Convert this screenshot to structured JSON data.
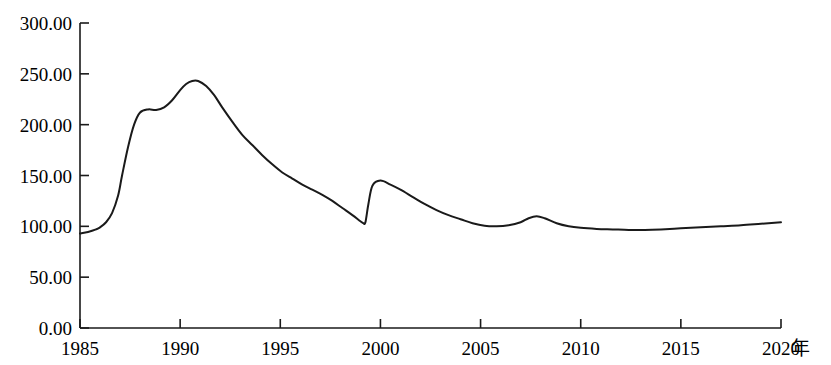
{
  "chart_data": {
    "type": "line",
    "title": "",
    "subtitle": "",
    "xlabel": "年",
    "ylabel": "",
    "xlim": [
      1985,
      2020
    ],
    "ylim": [
      0,
      300
    ],
    "grid": false,
    "legend": null,
    "x_ticks": [
      "1985",
      "1990",
      "1995",
      "2000",
      "2005",
      "2010",
      "2015",
      "2020"
    ],
    "x_tick_values": [
      1985,
      1990,
      1995,
      2000,
      2005,
      2010,
      2015,
      2020
    ],
    "y_ticks": [
      "0.00",
      "50.00",
      "100.00",
      "150.00",
      "200.00",
      "250.00",
      "300.00"
    ],
    "y_tick_values": [
      0,
      50,
      100,
      150,
      200,
      250,
      300
    ],
    "line_color": "#1a1a1a",
    "line_width": 2,
    "series": [
      {
        "name": "index",
        "x": [
          1985.0,
          1985.4,
          1985.8,
          1986.0,
          1986.3,
          1986.6,
          1986.9,
          1987.1,
          1987.4,
          1987.7,
          1988.0,
          1988.4,
          1988.8,
          1989.2,
          1989.6,
          1990.0,
          1990.3,
          1990.6,
          1990.9,
          1991.3,
          1991.7,
          1992.1,
          1992.6,
          1993.1,
          1993.6,
          1994.1,
          1994.6,
          1995.1,
          1995.6,
          1996.1,
          1996.6,
          1997.1,
          1997.6,
          1998.1,
          1998.6,
          1999.0,
          1999.15,
          1999.25,
          1999.4,
          1999.6,
          2000.0,
          2000.5,
          2001.0,
          2001.6,
          2002.2,
          2002.8,
          2003.4,
          2004.0,
          2004.6,
          2005.2,
          2005.8,
          2006.4,
          2007.0,
          2007.4,
          2007.8,
          2008.2,
          2008.8,
          2009.4,
          2010.0,
          2010.8,
          2011.6,
          2012.4,
          2013.2,
          2014.0,
          2015.0,
          2016.0,
          2017.0,
          2018.0,
          2019.0,
          2020.0
        ],
        "y": [
          93.0,
          94.5,
          97.0,
          99.0,
          104.0,
          113.0,
          130.0,
          150.0,
          178.0,
          200.0,
          212.0,
          215.0,
          214.5,
          217.0,
          224.0,
          234.0,
          240.0,
          243.0,
          243.0,
          238.0,
          229.0,
          217.0,
          203.0,
          190.0,
          180.0,
          170.0,
          161.0,
          153.0,
          147.0,
          141.0,
          136.0,
          131.0,
          125.0,
          118.0,
          111.0,
          105.0,
          103.0,
          104.0,
          122.0,
          140.0,
          145.0,
          141.0,
          136.0,
          129.0,
          122.0,
          116.0,
          111.0,
          107.0,
          103.0,
          100.5,
          100.0,
          101.0,
          104.0,
          108.0,
          110.0,
          108.0,
          103.0,
          100.0,
          98.5,
          97.5,
          97.0,
          96.5,
          96.5,
          97.0,
          98.0,
          99.0,
          100.0,
          101.0,
          102.5,
          104.0
        ],
        "annotations": [
          {
            "label": "peak",
            "x": 1990.6,
            "y": 243.0
          },
          {
            "label": "local-bump",
            "x": 1988.4,
            "y": 215.0
          },
          {
            "label": "trough-before-spike",
            "x": 1999.15,
            "y": 103.0
          },
          {
            "label": "spike-peak",
            "x": 2000.0,
            "y": 145.0
          },
          {
            "label": "secondary-bump",
            "x": 2007.8,
            "y": 110.0
          },
          {
            "label": "minimum-late",
            "x": 2012.4,
            "y": 96.5
          }
        ]
      }
    ]
  },
  "axes": {
    "x_unit_label": "年"
  }
}
